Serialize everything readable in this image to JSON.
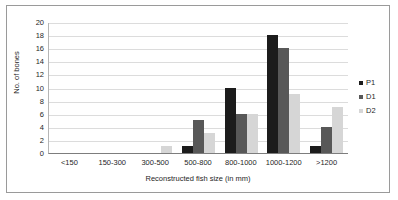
{
  "chart_data": {
    "type": "bar",
    "title": "",
    "subtitle": "",
    "xlabel": "Reconstructed fish size (in mm)",
    "ylabel": "No. of bones",
    "categories": [
      "<150",
      "150-300",
      "300-500",
      "500-800",
      "800-1000",
      "1000-1200",
      ">1200"
    ],
    "series": [
      {
        "name": "P1",
        "color": "#1c1c1c",
        "values": [
          0,
          0,
          0,
          1,
          10,
          18,
          1
        ]
      },
      {
        "name": "D1",
        "color": "#585858",
        "values": [
          0,
          0,
          0,
          5,
          6,
          16,
          4
        ]
      },
      {
        "name": "D2",
        "color": "#d6d6d6",
        "values": [
          0,
          0,
          1,
          3,
          6,
          9,
          7
        ]
      }
    ],
    "ylim": [
      0,
      20
    ],
    "ytick_values": [
      0,
      2,
      4,
      6,
      8,
      10,
      12,
      14,
      16,
      18,
      20
    ],
    "ytick_labels": [
      "0",
      "2",
      "4",
      "6",
      "8",
      "10",
      "12",
      "14",
      "16",
      "18",
      "20"
    ],
    "grid": true,
    "grid_axis": "y",
    "legend_position": "right",
    "bar_mode": "grouped"
  },
  "legend": {
    "items": [
      {
        "label": "P1"
      },
      {
        "label": "D1"
      },
      {
        "label": "D2"
      }
    ]
  }
}
